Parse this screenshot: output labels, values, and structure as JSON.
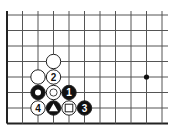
{
  "diagram": {
    "type": "go-board-fragment",
    "board": {
      "origin": {
        "x": 7,
        "y": 15
      },
      "spacing": 15.5,
      "columns": 11,
      "rows": 8,
      "right_edge_x": 168,
      "edges": [
        "left",
        "bottom"
      ],
      "line_color": "#555555",
      "edge_color": "#222222"
    },
    "hoshi": [
      {
        "col": 9,
        "row": 4
      }
    ],
    "stones": [
      {
        "col": 3,
        "row": 3,
        "color": "white",
        "label": "",
        "mark": ""
      },
      {
        "col": 2,
        "row": 4,
        "color": "white",
        "label": "",
        "mark": ""
      },
      {
        "col": 3,
        "row": 4,
        "color": "white",
        "label": "2",
        "mark": ""
      },
      {
        "col": 2,
        "row": 5,
        "color": "black",
        "label": "",
        "mark": "circle"
      },
      {
        "col": 3,
        "row": 5,
        "color": "white",
        "label": "",
        "mark": "circle"
      },
      {
        "col": 4,
        "row": 5,
        "color": "black",
        "label": "1",
        "mark": ""
      },
      {
        "col": 2,
        "row": 6,
        "color": "white",
        "label": "4",
        "mark": ""
      },
      {
        "col": 3,
        "row": 6,
        "color": "black",
        "label": "",
        "mark": "triangle"
      },
      {
        "col": 4,
        "row": 6,
        "color": "white",
        "label": "",
        "mark": "square"
      },
      {
        "col": 5,
        "row": 6,
        "color": "black",
        "label": "3",
        "mark": ""
      }
    ],
    "colors": {
      "black": "#111111",
      "white": "#ffffff",
      "stone_outline": "#222222"
    }
  }
}
